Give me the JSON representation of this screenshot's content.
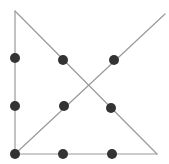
{
  "diagram": {
    "width": 169,
    "height": 164,
    "background": "#ffffff",
    "line_color": "#9a9a9a",
    "line_width": 1.2,
    "dot_color": "#333333",
    "dot_radius": 5,
    "path": [
      {
        "x": 165,
        "y": 14
      },
      {
        "x": 15,
        "y": 154
      },
      {
        "x": 15,
        "y": 11
      },
      {
        "x": 157,
        "y": 154
      },
      {
        "x": 15,
        "y": 154
      }
    ],
    "dots": [
      {
        "x": 15,
        "y": 58
      },
      {
        "x": 63,
        "y": 60
      },
      {
        "x": 114,
        "y": 60
      },
      {
        "x": 15,
        "y": 106
      },
      {
        "x": 64,
        "y": 106
      },
      {
        "x": 111,
        "y": 108
      },
      {
        "x": 15,
        "y": 154
      },
      {
        "x": 63,
        "y": 154
      },
      {
        "x": 112,
        "y": 154
      }
    ]
  }
}
